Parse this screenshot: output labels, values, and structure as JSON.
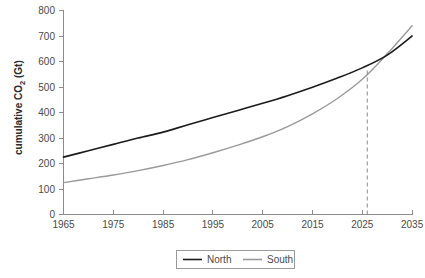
{
  "chart_data": {
    "type": "line",
    "title": "",
    "xlabel": "",
    "ylabel": "cumulative CO₂ (Gt)",
    "ylabel_main": "cumulative CO",
    "ylabel_sub": "2",
    "ylabel_unit": " (Gt)",
    "xlim": [
      1965,
      2035
    ],
    "ylim": [
      0,
      800
    ],
    "grid": false,
    "legend_position": "bottom-center",
    "x_ticks": [
      1965,
      1975,
      1985,
      1995,
      2005,
      2015,
      2025,
      2035
    ],
    "x_tick_labels": [
      "1965",
      "1975",
      "1985",
      "1995",
      "2005",
      "2015",
      "2025",
      "2035"
    ],
    "y_ticks": [
      0,
      100,
      200,
      300,
      400,
      500,
      600,
      700,
      800
    ],
    "y_tick_labels": [
      "0",
      "100",
      "200",
      "300",
      "400",
      "500",
      "600",
      "700",
      "800"
    ],
    "x": [
      1965,
      1970,
      1975,
      1980,
      1985,
      1990,
      1995,
      2000,
      2005,
      2010,
      2015,
      2020,
      2025,
      2030,
      2035
    ],
    "series": [
      {
        "name": "North",
        "color": "#1b1b1b",
        "values": [
          225,
          250,
          275,
          300,
          323,
          352,
          380,
          408,
          436,
          466,
          499,
          535,
          575,
          625,
          700
        ]
      },
      {
        "name": "South",
        "color": "#9a9a9a",
        "values": [
          125,
          140,
          155,
          172,
          192,
          215,
          242,
          272,
          305,
          345,
          395,
          455,
          530,
          630,
          740
        ]
      }
    ],
    "annotations": [
      {
        "name": "crossover-marker",
        "type": "vertical-dashed-line",
        "x": 2026,
        "y_from": 0,
        "y_to": 575,
        "color": "#8a8a8a"
      }
    ]
  },
  "legend": {
    "entries": [
      {
        "label": "North",
        "color": "#1b1b1b"
      },
      {
        "label": "South",
        "color": "#9a9a9a"
      }
    ]
  }
}
